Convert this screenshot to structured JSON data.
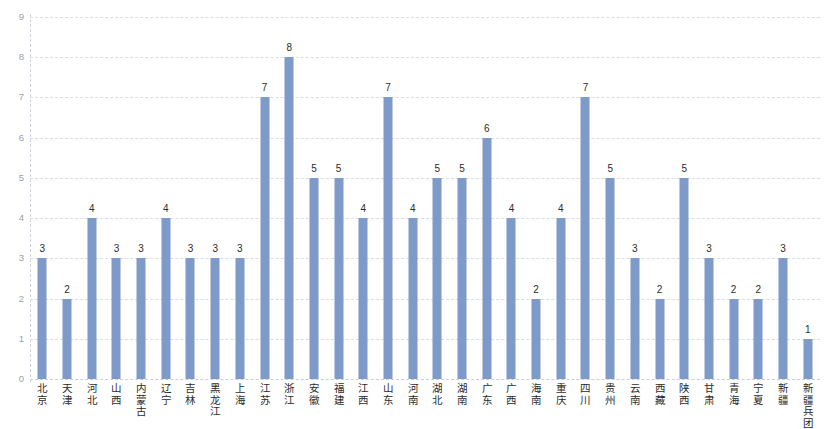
{
  "chart_data": {
    "type": "bar",
    "title": "",
    "subtitle": "",
    "xlabel": "",
    "ylabel": "",
    "ylim": [
      0,
      9
    ],
    "y_ticks": [
      0,
      1,
      2,
      3,
      4,
      5,
      6,
      7,
      8,
      9
    ],
    "grid": true,
    "grid_style": "dashed-horizontal",
    "legend": false,
    "legend_position": "none",
    "bar_color": "#7e9ac8",
    "value_labels": true,
    "categories": [
      "北京",
      "天津",
      "河北",
      "山西",
      "内蒙古",
      "辽宁",
      "吉林",
      "黑龙江",
      "上海",
      "江苏",
      "浙江",
      "安徽",
      "福建",
      "江西",
      "山东",
      "河南",
      "湖北",
      "湖南",
      "广东",
      "广西",
      "海南",
      "重庆",
      "四川",
      "贵州",
      "云南",
      "西藏",
      "陕西",
      "甘肃",
      "青海",
      "宁夏",
      "新疆",
      "新疆兵团"
    ],
    "values": [
      3,
      2,
      4,
      3,
      3,
      4,
      3,
      3,
      3,
      7,
      8,
      5,
      5,
      4,
      7,
      4,
      5,
      5,
      6,
      4,
      2,
      4,
      7,
      5,
      3,
      2,
      5,
      3,
      2,
      2,
      3,
      1
    ]
  }
}
